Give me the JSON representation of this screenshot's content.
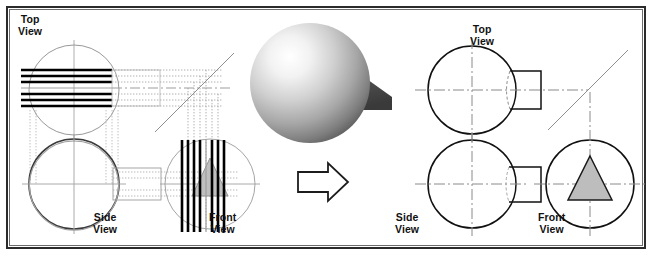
{
  "figure": {
    "border_color": "#2b2b2b",
    "background_color": "#ffffff"
  },
  "transition": {
    "arrow_name": "right-arrow",
    "direction": "right"
  },
  "pictorial": {
    "name": "shaded-sphere-with-triangular-prism",
    "sphere_highlight_color": "#ffffff",
    "sphere_mid_color": "#c9c9c9",
    "sphere_shadow_color": "#6a6a6a",
    "prism_top_color": "#d8d8d8",
    "prism_face_color": "#4a4a4a"
  },
  "left_panel": {
    "name": "construction-drawing",
    "description": "Projection construction with alignment lines",
    "views": [
      {
        "id": "top",
        "label": "Top\nView",
        "label_x": 18,
        "label_y": 14
      },
      {
        "id": "side",
        "label": "Side\nView",
        "label_x": 93,
        "label_y": 212
      },
      {
        "id": "front",
        "label": "Front\nView",
        "label_x": 209,
        "label_y": 212
      }
    ],
    "miter_line": true,
    "projection_line_color": "#000000",
    "dim_line_color": "#b9b9b9"
  },
  "right_panel": {
    "name": "finished-drawing",
    "description": "Completed three-view orthographic drawing",
    "views": [
      {
        "id": "top",
        "label": "Top\nView",
        "label_x": 470,
        "label_y": 24
      },
      {
        "id": "side",
        "label": "Side\nView",
        "label_x": 395,
        "label_y": 212
      },
      {
        "id": "front",
        "label": "Front\nView",
        "label_x": 538,
        "label_y": 212
      }
    ],
    "miter_line": true,
    "object_line_color": "#000000",
    "center_line_color": "#7d7d7d",
    "hidden_line_color": "#8a8a8a",
    "triangle_fill_color": "#bdbdbd"
  }
}
